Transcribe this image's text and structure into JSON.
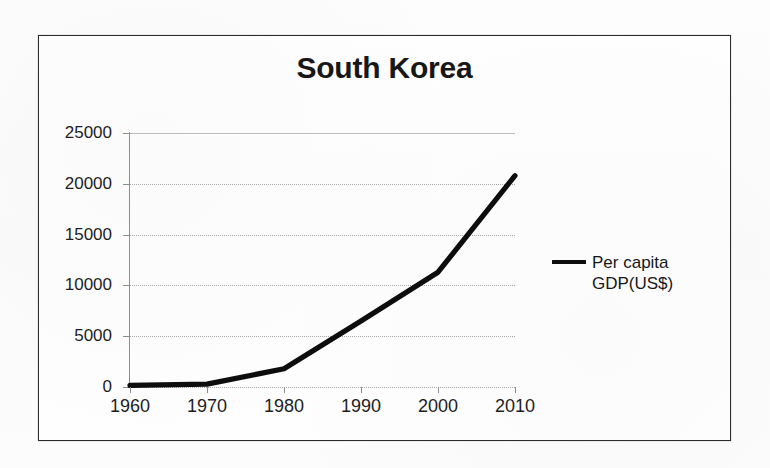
{
  "chart": {
    "title": "South Korea",
    "legend_label": "Per capita\nGDP(US$)"
  },
  "chart_data": {
    "type": "line",
    "title": "South Korea",
    "xlabel": "",
    "ylabel": "",
    "x": [
      1960,
      1970,
      1980,
      1990,
      2000,
      2010
    ],
    "categories": [
      "1960",
      "1970",
      "1980",
      "1990",
      "2000",
      "2010"
    ],
    "series": [
      {
        "name": "Per capita GDP(US$)",
        "values": [
          158,
          280,
          1800,
          6500,
          11300,
          20800
        ],
        "color": "#0d0d0d"
      }
    ],
    "xlim": [
      1960,
      2010
    ],
    "ylim": [
      0,
      25000
    ],
    "ytick_labels": [
      "0",
      "5000",
      "10000",
      "15000",
      "20000",
      "25000"
    ],
    "yticks": [
      0,
      5000,
      10000,
      15000,
      20000,
      25000
    ],
    "xtick_labels": [
      "1960",
      "1970",
      "1980",
      "1990",
      "2000",
      "2010"
    ],
    "grid": true,
    "grid_axis": "y",
    "legend_position": "right"
  }
}
